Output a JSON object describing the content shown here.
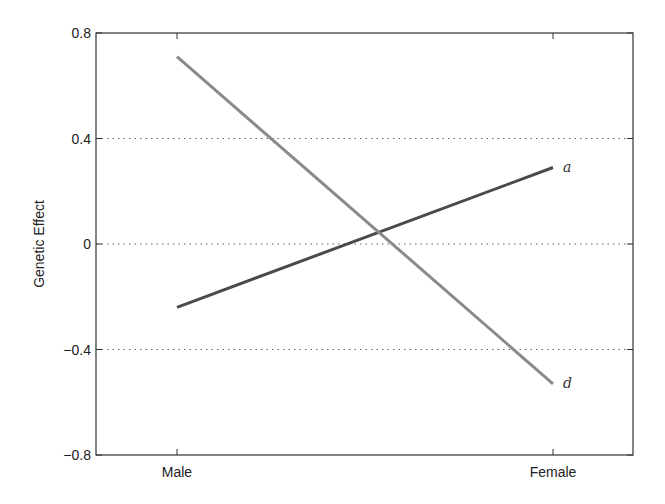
{
  "chart_data": {
    "type": "line",
    "title": "",
    "xlabel": "",
    "ylabel": "Genetic Effect",
    "categories": [
      "Male",
      "Female"
    ],
    "ylim": [
      -0.8,
      0.8
    ],
    "yticks": [
      -0.8,
      -0.4,
      0,
      0.4,
      0.8
    ],
    "ytick_labels": [
      "−0.8",
      "−0.4",
      "0",
      "0.4",
      "0.8"
    ],
    "grid": {
      "y": true,
      "style": "dotted",
      "lines_at": [
        -0.4,
        0,
        0.4
      ]
    },
    "legend": "inline labels at line ends",
    "series": [
      {
        "name": "a",
        "values": [
          -0.24,
          0.29
        ],
        "color": "#4a4a4a"
      },
      {
        "name": "d",
        "values": [
          0.71,
          -0.53
        ],
        "color": "#8a8a8a"
      }
    ]
  }
}
